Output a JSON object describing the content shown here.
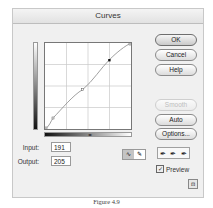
{
  "dialog": {
    "title": "Curves",
    "buttons": {
      "ok": "OK",
      "cancel": "Cancel",
      "help": "Help",
      "smooth": "Smooth",
      "auto": "Auto",
      "options": "Options..."
    },
    "input": {
      "label": "Input:",
      "value": "191"
    },
    "output": {
      "label": "Output:",
      "value": "205"
    },
    "tools": {
      "curve_tool": "curve-point-icon",
      "pencil_tool": "pencil-icon"
    },
    "eyedroppers": [
      "eyedropper-black-icon",
      "eyedropper-gray-icon",
      "eyedropper-white-icon"
    ],
    "eyedropper_glyph": "✒",
    "preview": {
      "label": "Preview",
      "checked": true,
      "check_glyph": "✓"
    },
    "resize_glyph": "⊡",
    "midpoint_glyph": "◂▸",
    "curve_points": [
      [
        0,
        0
      ],
      [
        24,
        32
      ],
      [
        112,
        117
      ],
      [
        191,
        205
      ],
      [
        255,
        255
      ]
    ]
  },
  "caption": "Figure 4.9"
}
